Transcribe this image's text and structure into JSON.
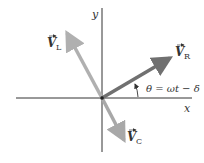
{
  "diagram": {
    "type": "phasor-diagram",
    "axes": {
      "x_label": "x",
      "y_label": "y"
    },
    "vectors": [
      {
        "name": "V_L",
        "symbol": "V",
        "subscript": "L",
        "color": "#b0b0b0"
      },
      {
        "name": "V_R",
        "symbol": "V",
        "subscript": "R",
        "color": "#707070"
      },
      {
        "name": "V_C",
        "symbol": "V",
        "subscript": "C",
        "color": "#a8a8a8"
      }
    ],
    "angle_label": "θ = ωt − δ"
  }
}
